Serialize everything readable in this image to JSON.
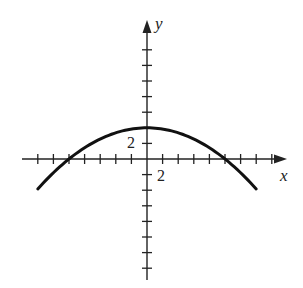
{
  "chart_data": {
    "type": "line",
    "title": "",
    "xlabel": "x",
    "ylabel": "y",
    "tick_step": 2,
    "x_tick_label": "2",
    "y_tick_label": "2",
    "xlim": [
      -16,
      18
    ],
    "ylim": [
      -16,
      16
    ],
    "grid": false,
    "legend": null,
    "series": [
      {
        "name": "parabola",
        "equation": "y = 4 - x^2/25",
        "vertex": [
          0,
          4
        ],
        "x_intercepts": [
          -10,
          10
        ],
        "x": [
          -14,
          -12,
          -10,
          -8,
          -6,
          -4,
          -2,
          0,
          2,
          4,
          6,
          8,
          10,
          12,
          14
        ],
        "y": [
          -3.84,
          -1.76,
          0,
          1.44,
          2.56,
          3.36,
          3.84,
          4,
          3.84,
          3.36,
          2.56,
          1.44,
          0,
          -1.76,
          -3.84
        ]
      }
    ],
    "colors": {
      "curve": "#111111",
      "axes": "#222222"
    }
  }
}
